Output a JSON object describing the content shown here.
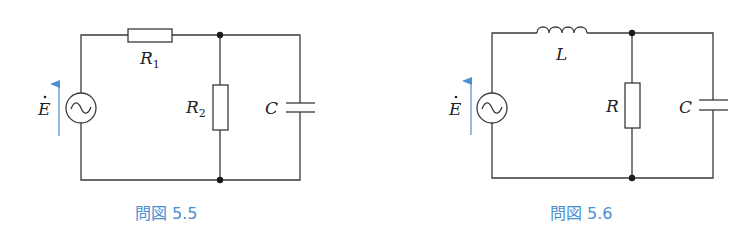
{
  "figures": [
    {
      "caption": "問図 5.5",
      "source_label": "E",
      "components": [
        {
          "type": "resistor",
          "label": "R",
          "subscript": "1",
          "position": "series-top"
        },
        {
          "type": "resistor",
          "label": "R",
          "subscript": "2",
          "position": "shunt"
        },
        {
          "type": "capacitor",
          "label": "C",
          "subscript": "",
          "position": "shunt"
        }
      ]
    },
    {
      "caption": "問図 5.6",
      "source_label": "E",
      "components": [
        {
          "type": "inductor",
          "label": "L",
          "subscript": "",
          "position": "series-top"
        },
        {
          "type": "resistor",
          "label": "R",
          "subscript": "",
          "position": "shunt"
        },
        {
          "type": "capacitor",
          "label": "C",
          "subscript": "",
          "position": "shunt"
        }
      ]
    }
  ],
  "colors": {
    "wire": "#3a3a3a",
    "arrow": "#4a90d0",
    "caption": "#4a90d0"
  }
}
